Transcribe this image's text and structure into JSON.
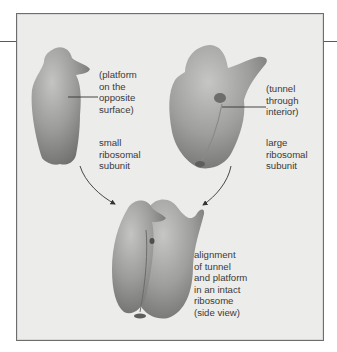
{
  "figure": {
    "panels": {
      "small_subunit": {
        "callout": "(platform\non the\nopposite\nsurface)",
        "name": "small\nribosomal\nsubunit"
      },
      "large_subunit": {
        "callout": "(tunnel\nthrough\ninterior)",
        "name": "large\nribosomal\nsubunit"
      },
      "intact_ribosome": {
        "caption": "alignment\nof tunnel\nand platform\nin an intact\nribosome\n(side view)"
      }
    },
    "colors": {
      "background": "#ececea",
      "border": "#6e6e6e",
      "subunit_fill": "#9a9a98",
      "text": "#3a3a3a"
    }
  }
}
